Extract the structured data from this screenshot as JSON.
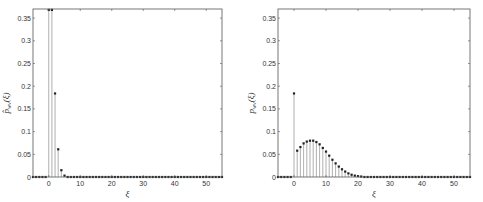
{
  "chart_data": [
    {
      "type": "stem",
      "title": "",
      "xlabel": "ξ",
      "ylabel": "p̂_wv(ξ)",
      "xlim": [
        -5,
        55
      ],
      "ylim": [
        0,
        0.37
      ],
      "xticks": [
        0,
        10,
        20,
        30,
        40,
        50
      ],
      "yticks": [
        0,
        0.05,
        0.1,
        0.15,
        0.2,
        0.25,
        0.3,
        0.35
      ],
      "ytick_labels": [
        "0",
        "0.05",
        "0.1",
        "0.15",
        "0.2",
        "0.25",
        "0.3",
        "0.35"
      ],
      "grid": false,
      "x": [
        -5,
        -4,
        -3,
        -2,
        -1,
        0,
        1,
        2,
        3,
        4,
        5,
        6,
        7,
        8,
        9,
        10,
        11,
        12,
        13,
        14,
        15,
        16,
        17,
        18,
        19,
        20,
        21,
        22,
        23,
        24,
        25,
        26,
        27,
        28,
        29,
        30,
        31,
        32,
        33,
        34,
        35,
        36,
        37,
        38,
        39,
        40,
        41,
        42,
        43,
        44,
        45,
        46,
        47,
        48,
        49,
        50,
        51,
        52,
        53,
        54,
        55
      ],
      "values": [
        0,
        0,
        0,
        0,
        0,
        0.368,
        0.368,
        0.184,
        0.061,
        0.015,
        0.003,
        0,
        0,
        0,
        0,
        0,
        0,
        0,
        0,
        0,
        0,
        0,
        0,
        0,
        0,
        0,
        0,
        0,
        0,
        0,
        0,
        0,
        0,
        0,
        0,
        0,
        0,
        0,
        0,
        0,
        0,
        0,
        0,
        0,
        0,
        0,
        0,
        0,
        0,
        0,
        0,
        0,
        0,
        0,
        0,
        0,
        0,
        0,
        0,
        0,
        0
      ]
    },
    {
      "type": "stem",
      "title": "",
      "xlabel": "ξ",
      "ylabel": "p_wv(ξ)",
      "xlim": [
        -5,
        55
      ],
      "ylim": [
        0,
        0.37
      ],
      "xticks": [
        0,
        10,
        20,
        30,
        40,
        50
      ],
      "yticks": [
        0,
        0.05,
        0.1,
        0.15,
        0.2,
        0.25,
        0.3,
        0.35
      ],
      "ytick_labels": [
        "0",
        "0.05",
        "0.1",
        "0.15",
        "0.2",
        "0.25",
        "0.3",
        "0.35"
      ],
      "grid": false,
      "x": [
        -5,
        -4,
        -3,
        -2,
        -1,
        0,
        1,
        2,
        3,
        4,
        5,
        6,
        7,
        8,
        9,
        10,
        11,
        12,
        13,
        14,
        15,
        16,
        17,
        18,
        19,
        20,
        21,
        22,
        23,
        24,
        25,
        26,
        27,
        28,
        29,
        30,
        31,
        32,
        33,
        34,
        35,
        36,
        37,
        38,
        39,
        40,
        41,
        42,
        43,
        44,
        45,
        46,
        47,
        48,
        49,
        50,
        51,
        52,
        53,
        54,
        55
      ],
      "values": [
        0,
        0,
        0,
        0,
        0,
        0.184,
        0.058,
        0.066,
        0.074,
        0.078,
        0.08,
        0.08,
        0.077,
        0.072,
        0.064,
        0.056,
        0.047,
        0.038,
        0.03,
        0.023,
        0.017,
        0.012,
        0.008,
        0.005,
        0.003,
        0.002,
        0.001,
        0,
        0,
        0,
        0,
        0,
        0,
        0,
        0,
        0,
        0,
        0,
        0,
        0,
        0,
        0,
        0,
        0,
        0,
        0,
        0,
        0,
        0,
        0,
        0,
        0,
        0,
        0,
        0,
        0,
        0,
        0,
        0,
        0,
        0
      ]
    }
  ],
  "plots": [
    {
      "xlabel": "ξ",
      "ylabel_main": "p̂",
      "ylabel_sub": "wv",
      "ylabel_arg": "(ξ)"
    },
    {
      "xlabel": "ξ",
      "ylabel_main": "p",
      "ylabel_sub": "wv",
      "ylabel_arg": "(ξ)"
    }
  ]
}
